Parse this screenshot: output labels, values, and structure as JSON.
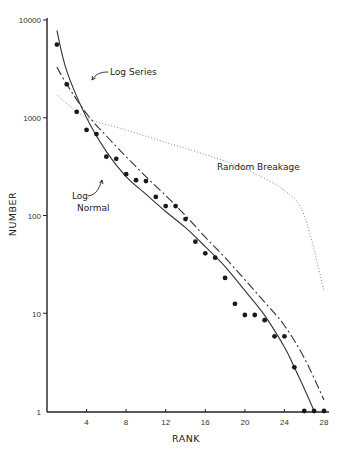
{
  "chart_data": {
    "type": "scatter",
    "title": "",
    "xlabel": "RANK",
    "ylabel": "NUMBER",
    "x_scale": "linear",
    "y_scale": "log",
    "xlim": [
      0,
      28
    ],
    "ylim": [
      1,
      10000
    ],
    "grid": false,
    "x_ticks": [
      4,
      8,
      12,
      16,
      20,
      24,
      28
    ],
    "x_tick_labels": [
      "4",
      "8",
      "12",
      "16",
      "20",
      "24",
      "28"
    ],
    "y_ticks": [
      1,
      10,
      100,
      1000,
      10000
    ],
    "y_tick_labels": [
      "1",
      "10",
      "100",
      "1000",
      "10000"
    ],
    "series": [
      {
        "name": "Observed",
        "style": "points",
        "x": [
          1,
          2,
          3,
          4,
          5,
          6,
          7,
          8,
          9,
          10,
          11,
          12,
          13,
          14,
          15,
          16,
          17,
          18,
          19,
          20,
          21,
          22,
          23,
          24,
          25,
          26,
          27,
          28
        ],
        "values": [
          5600,
          2200,
          1150,
          750,
          680,
          400,
          380,
          265,
          230,
          225,
          155,
          125,
          125,
          92,
          54,
          41,
          37,
          23,
          12.5,
          9.6,
          9.6,
          8.5,
          5.8,
          5.8,
          2.8,
          1,
          1,
          1
        ]
      },
      {
        "name": "Log Normal",
        "style": "solid",
        "x": [
          1,
          2,
          4,
          6,
          8,
          10,
          12,
          14,
          16,
          18,
          20,
          22,
          24,
          25,
          26,
          27
        ],
        "values": [
          7800,
          3000,
          1000,
          450,
          250,
          165,
          110,
          75,
          48,
          30,
          17,
          9.5,
          4.5,
          2.8,
          1.7,
          1
        ]
      },
      {
        "name": "Log Series",
        "style": "dash",
        "x": [
          1,
          2,
          4,
          6,
          8,
          10,
          12,
          14,
          16,
          18,
          20,
          22,
          24,
          26,
          28
        ],
        "values": [
          3300,
          2200,
          1100,
          650,
          400,
          250,
          160,
          100,
          60,
          37,
          22,
          13,
          7.5,
          3.5,
          1.3
        ]
      },
      {
        "name": "Random Breakage",
        "style": "dotted",
        "x": [
          1,
          4,
          8,
          12,
          16,
          20,
          24,
          26,
          28
        ],
        "values": [
          1700,
          1000,
          750,
          560,
          420,
          300,
          180,
          100,
          17
        ]
      }
    ],
    "annotations": [
      {
        "text": "Log Series",
        "x": 8.2,
        "y": 1550,
        "arrow_to_series": "Log Series"
      },
      {
        "text": "Random Breakage",
        "x": 19.5,
        "y": 560
      },
      {
        "text": "Log",
        "x": 3.3,
        "y": 255,
        "arrow_to_series": "Log Normal"
      },
      {
        "text": "Normal",
        "x": 3.0,
        "y": 165
      }
    ],
    "legend": "none (inline annotations)"
  },
  "labels": {
    "xlabel": "RANK",
    "ylabel": "NUMBER",
    "log_series": "Log Series",
    "random_breakage": "Random Breakage",
    "log_normal_line1": "Log",
    "log_normal_line2": "Normal"
  },
  "axis": {
    "y_ticks": [
      "10000",
      "1000",
      "100",
      "10",
      "1"
    ],
    "x_ticks": [
      "4",
      "8",
      "12",
      "16",
      "20",
      "24",
      "28"
    ]
  },
  "colors": {
    "ink": "#222222",
    "dotted": "#777777",
    "background": "#ffffff"
  }
}
